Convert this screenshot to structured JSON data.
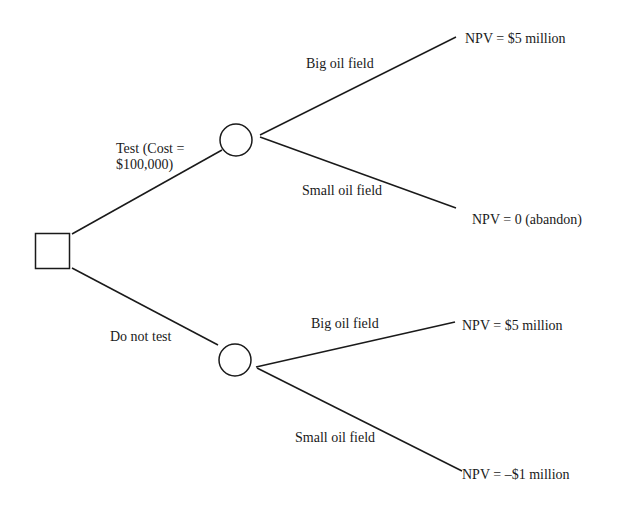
{
  "diagram": {
    "type": "decision-tree",
    "decision_node": {
      "shape": "square"
    },
    "branches": [
      {
        "label_line1": "Test (Cost =",
        "label_line2": "$100,000)",
        "chance_node": {
          "shape": "circle"
        },
        "outcomes": [
          {
            "label": "Big oil field",
            "payoff": "NPV = $5 million"
          },
          {
            "label": "Small oil field",
            "payoff": "NPV = 0 (abandon)"
          }
        ]
      },
      {
        "label": "Do not test",
        "chance_node": {
          "shape": "circle"
        },
        "outcomes": [
          {
            "label": "Big oil field",
            "payoff": "NPV = $5 million"
          },
          {
            "label": "Small oil field",
            "payoff": "NPV = –$1 million"
          }
        ]
      }
    ],
    "colors": {
      "line": "#1a1a1a",
      "background": "#ffffff"
    }
  }
}
